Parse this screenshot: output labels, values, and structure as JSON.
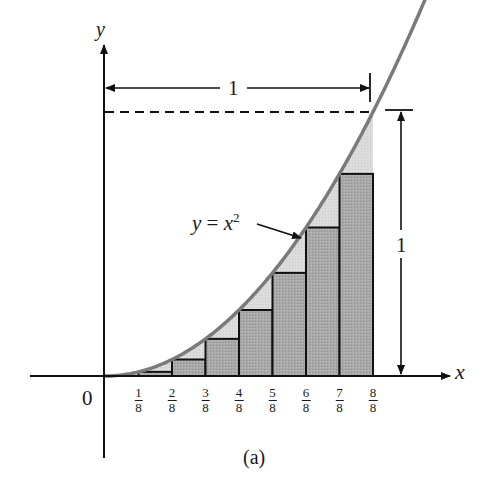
{
  "figure": {
    "caption": "(a)",
    "x_axis_label": "x",
    "y_axis_label": "y",
    "origin_label": "0",
    "curve_label": "y = x²",
    "curve_label_parts": {
      "lhs": "y",
      "eq": "=",
      "base": "x",
      "exp": "2"
    },
    "width_dimension_label": "1",
    "height_dimension_label": "1",
    "tick_labels": [
      {
        "num": "1",
        "den": "8"
      },
      {
        "num": "2",
        "den": "8"
      },
      {
        "num": "3",
        "den": "8"
      },
      {
        "num": "4",
        "den": "8"
      },
      {
        "num": "5",
        "den": "8"
      },
      {
        "num": "6",
        "den": "8"
      },
      {
        "num": "7",
        "den": "8"
      },
      {
        "num": "8",
        "den": "8"
      }
    ]
  },
  "chart_data": {
    "type": "area",
    "title": "",
    "function": "y = x^2",
    "xlabel": "x",
    "ylabel": "y",
    "xlim": [
      0,
      1
    ],
    "ylim": [
      0,
      1
    ],
    "n_subintervals": 8,
    "x": [
      0,
      0.125,
      0.25,
      0.375,
      0.5,
      0.625,
      0.75,
      0.875,
      1.0
    ],
    "rectangles": [
      {
        "x0": 0.0,
        "x1": 0.125,
        "height": 0.0
      },
      {
        "x0": 0.125,
        "x1": 0.25,
        "height": 0.015625
      },
      {
        "x0": 0.25,
        "x1": 0.375,
        "height": 0.0625
      },
      {
        "x0": 0.375,
        "x1": 0.5,
        "height": 0.140625
      },
      {
        "x0": 0.5,
        "x1": 0.625,
        "height": 0.25
      },
      {
        "x0": 0.625,
        "x1": 0.75,
        "height": 0.390625
      },
      {
        "x0": 0.75,
        "x1": 0.875,
        "height": 0.5625
      },
      {
        "x0": 0.875,
        "x1": 1.0,
        "height": 0.765625
      }
    ],
    "tick_labels": [
      "1/8",
      "2/8",
      "3/8",
      "4/8",
      "5/8",
      "6/8",
      "7/8",
      "8/8"
    ],
    "annotations": [
      "y = x^2 (arrow to curve at x=6/8)",
      "horizontal dimension 1 (from 0 to 1)",
      "vertical dimension 1 (from 0 to 1)",
      "dashed line at y=1"
    ],
    "grid": false,
    "legend": null
  },
  "colors": {
    "curve": "#7a7a7a",
    "rect_fill": "#a9a9a9",
    "gap_fill": "#d9d9d9",
    "ink": "#111111",
    "background": "#ffffff"
  }
}
